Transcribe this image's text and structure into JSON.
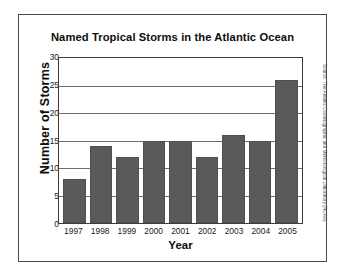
{
  "chart_data": {
    "type": "bar",
    "title": "Named Tropical Storms in the Atlantic Ocean",
    "xlabel": "Year",
    "ylabel": "Number of Storms",
    "categories": [
      "1997",
      "1998",
      "1999",
      "2000",
      "2001",
      "2002",
      "2003",
      "2004",
      "2005"
    ],
    "values": [
      8,
      14,
      12,
      15,
      15,
      12,
      16,
      15,
      26
    ],
    "ylim": [
      0,
      30
    ],
    "ytick_labels": [
      "30",
      "25",
      "20",
      "15",
      "10",
      "5",
      "0"
    ],
    "ytick_values": [
      30,
      25,
      20,
      15,
      10,
      5,
      0
    ],
    "ytick_step": 5,
    "grid": true,
    "legend": "none",
    "bar_color": "#5a5a5a",
    "gridline_color": "#6e6e6e",
    "axis_color": "#3c3c3c",
    "background_color": "#ffffff"
  },
  "source_note": "Source: The Atlantic Oceanographic and Meteorological Laboratory (NOAA)"
}
